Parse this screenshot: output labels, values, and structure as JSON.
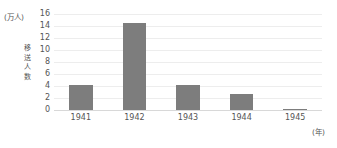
{
  "chart_data": {
    "type": "bar",
    "title": "",
    "subtitle": "",
    "xlabel": "(年)",
    "ylabel": "移送人数",
    "y_unit": "(万人)",
    "categories": [
      "1941",
      "1942",
      "1943",
      "1944",
      "1945"
    ],
    "values": [
      4.2,
      14.5,
      4.2,
      2.7,
      0.2
    ],
    "series": [
      {
        "name": "移送人数",
        "values": [
          4.2,
          14.5,
          4.2,
          2.7,
          0.2
        ]
      }
    ],
    "ylim": [
      0,
      16
    ],
    "ytick_labels": [
      "16",
      "14",
      "12",
      "10",
      "8",
      "6",
      "4",
      "2",
      "0"
    ],
    "ytick_values": [
      16,
      14,
      12,
      10,
      8,
      6,
      4,
      2,
      0
    ],
    "grid": true,
    "legend": "none",
    "bar_color": "#7d7d7d",
    "grid_color": "#ededed",
    "axis_color": "#d8d8d8",
    "text_color": "#555555",
    "background": "#ffffff"
  }
}
